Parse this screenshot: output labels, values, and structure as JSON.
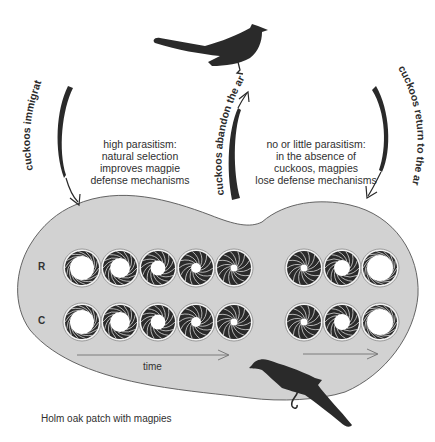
{
  "figure": {
    "top_left_text": [
      "high parasitism:",
      "natural selection",
      "improves magpie",
      "defense mechanisms"
    ],
    "top_right_text": [
      "no or little parasitism:",
      "in the absence of",
      "cuckoos, magpies",
      "lose defense mechanisms"
    ],
    "arrow_labels": {
      "left": "cuckoos immigrat",
      "middle": "cuckoos abandon the area",
      "right": "cuckoos return to the area"
    },
    "row_labels": {
      "top": "R",
      "bottom": "C"
    },
    "time_label": "time",
    "caption": "Holm oak patch with magpies",
    "icons": {
      "top_bird": "cuckoo-silhouette",
      "bottom_bird": "magpie-silhouette",
      "circles": "aperture-iris-diagram"
    },
    "colors": {
      "patch_fill": "#d2d2d2",
      "patch_stroke": "#555555",
      "silhouette": "#2a2a2a",
      "text": "#2f2f2f",
      "arrow_line": "#666666"
    },
    "rows": {
      "R": {
        "left_group_aperture_radii": [
          12,
          10,
          7.5,
          5,
          3.5
        ],
        "right_group_aperture_radii": [
          3.5,
          8,
          13
        ]
      },
      "C": {
        "left_group_aperture_radii": [
          12,
          10,
          7.5,
          5,
          3.5
        ],
        "right_group_aperture_radii": [
          3.5,
          8,
          13
        ]
      }
    }
  }
}
